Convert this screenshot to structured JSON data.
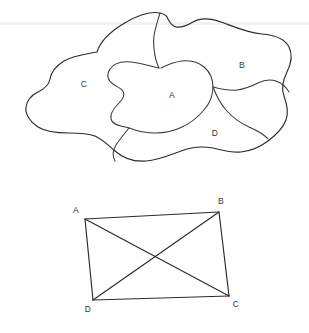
{
  "figure": {
    "background_color": "#ffffff",
    "ink_color": "#2b2b2b",
    "scan_artifact": {
      "type": "horizontal-band",
      "color": "#f0f0f0",
      "y": 22,
      "height": 3
    }
  },
  "blob_map": {
    "name": "four-region-blob",
    "description": "Irregular closed outline subdivided into four labelled regions",
    "regions": [
      {
        "id": "A",
        "label": "A",
        "x": 172,
        "y": 96
      },
      {
        "id": "B",
        "label": "B",
        "x": 242,
        "y": 66
      },
      {
        "id": "C",
        "label": "C",
        "x": 84,
        "y": 85
      },
      {
        "id": "D",
        "label": "D",
        "x": 215,
        "y": 134
      }
    ],
    "outline_path": "M 97 52 C 100 42, 110 32, 123 24 C 135 16, 150 11, 160 13 C 165 14, 167 16, 168 19 C 170 23, 172 26, 176 27 C 182 28, 188 25, 193 22 C 200 18, 210 18, 221 22 C 235 27, 248 33, 262 34 C 275 35, 285 39, 289 47 C 293 55, 291 64, 287 72 C 283 80, 281 88, 284 96 C 287 104, 289 112, 286 120 C 283 128, 276 135, 268 141 C 260 147, 251 151, 241 152 C 231 153, 222 150, 213 148 C 202 146, 191 147, 181 151 C 170 155, 158 160, 146 161 C 134 162, 123 158, 115 151 C 108 145, 102 139, 95 136 C 87 133, 78 133, 69 133 C 58 133, 46 132, 38 127 C 30 122, 25 114, 26 107 C 27 100, 32 95, 38 92 C 44 89, 49 85, 50 79 C 51 72, 56 66, 64 61 C 74 55, 87 54, 97 52 Z",
    "divider_paths": [
      "M 160 13 C 158 20, 155 28, 154 36 C 153 44, 154 52, 156 60 C 157 64, 158 66, 159 68",
      "M 159 68 C 150 66, 140 63, 131 62 C 122 61, 114 63, 110 69 C 106 75, 108 81, 113 84 C 117 87, 121 88, 123 91 C 125 95, 123 99, 119 103 C 114 108, 110 114, 111 119 C 112 123, 116 125, 121 126 C 124 127, 127 127, 129 128",
      "M 129 128 C 137 131, 146 133, 155 133 C 165 133, 174 131, 182 127 C 191 123, 198 117, 204 110 C 210 103, 213 95, 213 87 C 213 79, 210 72, 204 67 C 198 62, 190 60, 182 61 C 174 62, 167 65, 161 68",
      "M 213 87 C 221 89, 229 91, 237 90 C 245 89, 252 86, 258 83 C 264 80, 270 79, 276 81 C 282 83, 286 87, 289 92",
      "M 129 128 C 125 133, 120 139, 116 145 C 113 150, 112 156, 115 161",
      "M 213 87 C 216 95, 220 103, 226 110 C 232 117, 240 123, 249 127 C 256 130, 263 133, 268 139"
    ]
  },
  "quadrilateral": {
    "name": "quadrilateral-abcd",
    "description": "Quadrilateral ABCD with both diagonals drawn",
    "vertices": [
      {
        "id": "A",
        "label": "A",
        "x": 85,
        "y": 219,
        "label_x": 76,
        "label_y": 211
      },
      {
        "id": "B",
        "label": "B",
        "x": 219,
        "y": 212,
        "label_x": 221,
        "label_y": 202
      },
      {
        "id": "C",
        "label": "C",
        "x": 229,
        "y": 296,
        "label_x": 236,
        "label_y": 305
      },
      {
        "id": "D",
        "label": "D",
        "x": 93,
        "y": 300,
        "label_x": 88,
        "label_y": 310
      }
    ],
    "edges": [
      {
        "from": "A",
        "to": "B",
        "name": "side-ab"
      },
      {
        "from": "B",
        "to": "C",
        "name": "side-bc"
      },
      {
        "from": "C",
        "to": "D",
        "name": "side-cd"
      },
      {
        "from": "D",
        "to": "A",
        "name": "side-da"
      }
    ],
    "diagonals": [
      {
        "from": "A",
        "to": "C",
        "name": "diagonal-ac"
      },
      {
        "from": "B",
        "to": "D",
        "name": "diagonal-bd"
      }
    ],
    "diagonal_intersection": {
      "x": 153,
      "y": 257
    }
  }
}
